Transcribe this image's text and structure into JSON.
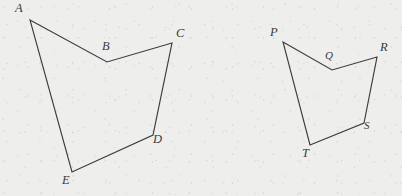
{
  "figure": {
    "canvas": {
      "width": 402,
      "height": 196
    },
    "style": {
      "background_color": "#eeeeec",
      "stroke_color": "#3c3c3c",
      "label_color": "#3a3a3a",
      "stroke_width": 1.15
    },
    "shapes": [
      {
        "name": "pentagon-abcde",
        "label_sequence": "ABCDE",
        "closed": true,
        "points": "30,20 107,62 172,43 153,135 72,172",
        "vertices": [
          {
            "id": "A",
            "label": "A",
            "x": 30,
            "y": 20,
            "label_x": 15,
            "label_y": 2
          },
          {
            "id": "B",
            "label": "B",
            "x": 107,
            "y": 62,
            "label_x": 102,
            "label_y": 40
          },
          {
            "id": "C",
            "label": "C",
            "x": 172,
            "y": 43,
            "label_x": 176,
            "label_y": 27
          },
          {
            "id": "D",
            "label": "D",
            "x": 153,
            "y": 135,
            "label_x": 153,
            "label_y": 133
          },
          {
            "id": "E",
            "label": "E",
            "x": 72,
            "y": 172,
            "label_x": 62,
            "label_y": 174
          }
        ]
      },
      {
        "name": "pentagon-pqrst",
        "label_sequence": "PQRST",
        "closed": true,
        "points": "283,42 332,70 377,57 364,123 310,145",
        "vertices": [
          {
            "id": "P",
            "label": "P",
            "x": 283,
            "y": 42,
            "label_x": 270,
            "label_y": 26
          },
          {
            "id": "Q",
            "label": "Q",
            "x": 332,
            "y": 70,
            "label_x": 325,
            "label_y": 50
          },
          {
            "id": "R",
            "label": "R",
            "x": 377,
            "y": 57,
            "label_x": 380,
            "label_y": 41
          },
          {
            "id": "S",
            "label": "S",
            "x": 364,
            "y": 123,
            "label_x": 364,
            "label_y": 120
          },
          {
            "id": "T",
            "label": "T",
            "x": 310,
            "y": 145,
            "label_x": 302,
            "label_y": 147
          }
        ]
      }
    ]
  }
}
